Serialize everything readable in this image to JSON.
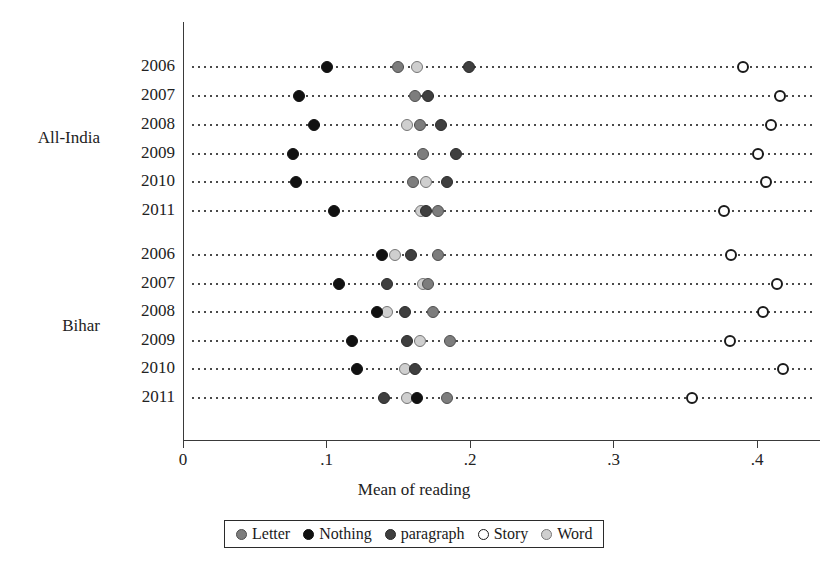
{
  "chart_data": {
    "type": "scatter",
    "title": "",
    "xlabel": "Mean of reading",
    "ylabel": "",
    "xlim": [
      0,
      0.45
    ],
    "xticks": [
      0,
      0.1,
      0.2,
      0.3,
      0.4
    ],
    "xticklabels": [
      "0",
      ".1",
      ".2",
      ".3",
      ".4"
    ],
    "grid": "dotted horizontal row guides",
    "legend_position": "bottom",
    "legend": [
      "Letter",
      "Nothing",
      "paragraph",
      "Story",
      "Word"
    ],
    "series_colors": {
      "Letter": "#7d7d7d",
      "Nothing": "#111111",
      "paragraph": "#3f3f3f",
      "Story": "#ffffff",
      "Word": "#cfcfcf"
    },
    "groups": [
      {
        "name": "All-India",
        "rows": [
          {
            "year": "2006",
            "Nothing": 0.1,
            "Letter": 0.15,
            "Word": 0.163,
            "paragraph": 0.199,
            "Story": 0.39
          },
          {
            "year": "2007",
            "Nothing": 0.081,
            "Letter": 0.162,
            "paragraph": 0.171,
            "Story": 0.416
          },
          {
            "year": "2008",
            "Nothing": 0.091,
            "Word": 0.156,
            "Letter": 0.165,
            "paragraph": 0.18,
            "Story": 0.41
          },
          {
            "year": "2009",
            "Nothing": 0.077,
            "Letter": 0.167,
            "paragraph": 0.19,
            "Story": 0.401
          },
          {
            "year": "2010",
            "Nothing": 0.079,
            "Letter": 0.16,
            "Word": 0.169,
            "paragraph": 0.184,
            "Story": 0.406
          },
          {
            "year": "2011",
            "Nothing": 0.105,
            "Word": 0.166,
            "paragraph": 0.169,
            "Letter": 0.178,
            "Story": 0.377
          }
        ]
      },
      {
        "name": "Bihar",
        "rows": [
          {
            "year": "2006",
            "Nothing": 0.139,
            "Word": 0.148,
            "paragraph": 0.159,
            "Letter": 0.178,
            "Story": 0.382
          },
          {
            "year": "2007",
            "Nothing": 0.109,
            "paragraph": 0.142,
            "Word": 0.167,
            "Letter": 0.171,
            "Story": 0.414
          },
          {
            "year": "2008",
            "Nothing": 0.135,
            "Word": 0.142,
            "paragraph": 0.155,
            "Letter": 0.174,
            "Story": 0.404
          },
          {
            "year": "2009",
            "Nothing": 0.118,
            "paragraph": 0.156,
            "Word": 0.165,
            "Letter": 0.186,
            "Story": 0.381
          },
          {
            "year": "2010",
            "Nothing": 0.121,
            "Word": 0.155,
            "paragraph": 0.162,
            "Story": 0.418
          },
          {
            "year": "2011",
            "paragraph": 0.14,
            "Word": 0.156,
            "Nothing": 0.163,
            "Letter": 0.184,
            "Story": 0.355
          }
        ]
      }
    ]
  },
  "axis": {
    "x_title": "Mean of reading",
    "x_ticklabels": [
      "0",
      ".1",
      ".2",
      ".3",
      ".4"
    ]
  },
  "legend": {
    "items": [
      {
        "label": "Letter",
        "marker": "filled-circle-gray"
      },
      {
        "label": "Nothing",
        "marker": "filled-circle-black"
      },
      {
        "label": "paragraph",
        "marker": "filled-circle-darkgray"
      },
      {
        "label": "Story",
        "marker": "open-circle"
      },
      {
        "label": "Word",
        "marker": "filled-circle-lightgray"
      }
    ]
  }
}
